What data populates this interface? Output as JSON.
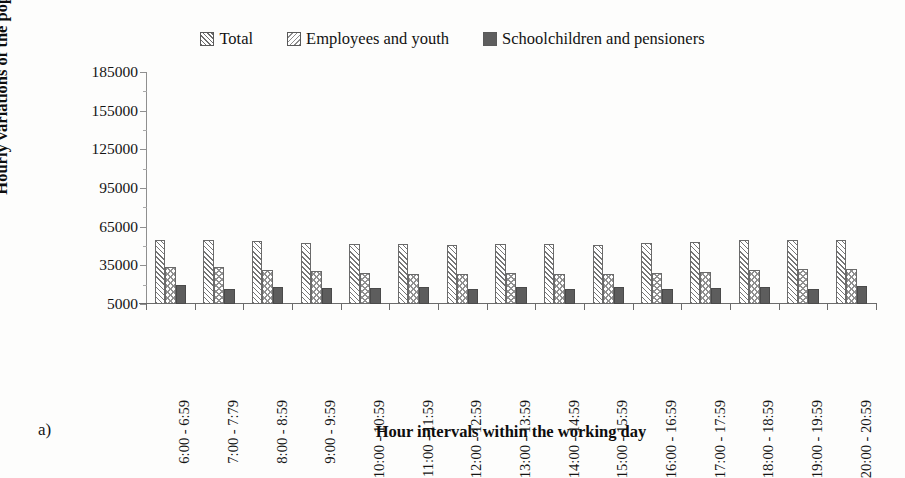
{
  "figure": {
    "subfigure_label": "a)",
    "background_color": "#fdfdfc"
  },
  "chart_data": {
    "type": "bar",
    "title": "",
    "xlabel": "Hour intervals within the working day",
    "ylabel": "Hourly variations of the population",
    "categories": [
      "6:00 - 6:59",
      "7:00 - 7:79",
      "8:00 - 8:59",
      "9:00 - 9:59",
      "10:00 - 10:59",
      "11:00 - 11:59",
      "12:00 - 12:59",
      "13:00 - 13:59",
      "14:00 - 14:59",
      "15:00 - 15:59",
      "16:00 - 16:59",
      "17:00 - 17:59",
      "18:00 - 18:59",
      "19:00 - 19:59",
      "20:00 - 20:59"
    ],
    "series": [
      {
        "name": "Total",
        "pattern": "diagonal-hatch-up",
        "color": "#757575",
        "values": [
          54500,
          54500,
          54000,
          52500,
          51500,
          51500,
          51000,
          51500,
          51500,
          51000,
          52500,
          53500,
          54500,
          54500,
          55000
        ]
      },
      {
        "name": "Employees and youth",
        "pattern": "chevron-hatch",
        "color": "#909090",
        "values": [
          33500,
          33500,
          31500,
          30500,
          29000,
          28500,
          28500,
          29000,
          28500,
          28500,
          29000,
          30000,
          31500,
          32500,
          32500
        ]
      },
      {
        "name": "Schoolchildren and pensioners",
        "pattern": "solid",
        "color": "#5d5d5d",
        "values": [
          19500,
          16500,
          18000,
          17500,
          17500,
          18000,
          17000,
          18000,
          16500,
          18000,
          17000,
          17500,
          18000,
          17000,
          19000
        ]
      }
    ],
    "ylim": [
      5000,
      185000
    ],
    "yticks": [
      5000,
      35000,
      65000,
      95000,
      125000,
      155000,
      185000
    ],
    "ytick_labels": [
      "5000",
      "35000",
      "65000",
      "95000",
      "125000",
      "155000",
      "185000"
    ],
    "y_minor_ticks_per_interval": 1,
    "grid": false,
    "legend_position": "top-center",
    "legend": [
      "Total",
      "Employees and youth",
      "Schoolchildren and pensioners"
    ]
  }
}
